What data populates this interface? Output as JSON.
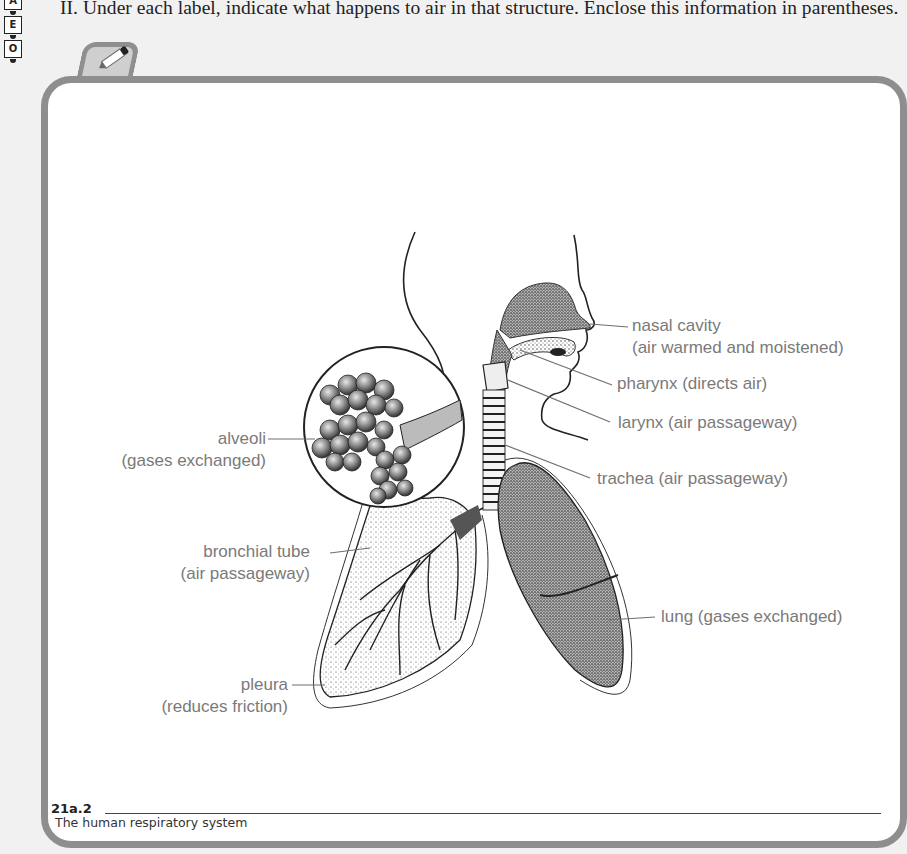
{
  "side_tabs": [
    "A",
    "E",
    "O"
  ],
  "instruction": "II. Under each label, indicate what happens to air in that structure. Enclose this information in parentheses.",
  "icons": {
    "pencil": "pencil-icon"
  },
  "colors": {
    "page_background": "#f1f1f1",
    "frame_border": "#8e8e8e",
    "label_text": "#7a7a7a",
    "leader_line": "#6e6e6e"
  },
  "diagram": {
    "title": "The human respiratory system",
    "labels": {
      "nasal_cavity": {
        "name": "nasal cavity",
        "function": "(air warmed and moistened)"
      },
      "pharynx": {
        "name": "pharynx",
        "function": "(directs air)",
        "full": "pharynx (directs air)"
      },
      "larynx": {
        "name": "larynx",
        "function": "(air passageway)",
        "full": "larynx (air passageway)"
      },
      "trachea": {
        "name": "trachea",
        "function": "(air passageway)",
        "full": "trachea (air passageway)"
      },
      "alveoli": {
        "name": "alveoli",
        "function": "(gases exchanged)"
      },
      "bronchial_tube": {
        "name": "bronchial tube",
        "function": "(air passageway)"
      },
      "lung": {
        "name": "lung",
        "function": "(gases exchanged)",
        "full": "lung (gases exchanged)"
      },
      "pleura": {
        "name": "pleura",
        "function": "(reduces friction)"
      }
    }
  },
  "figure": {
    "number": "21a.2",
    "caption": "The human respiratory system"
  }
}
